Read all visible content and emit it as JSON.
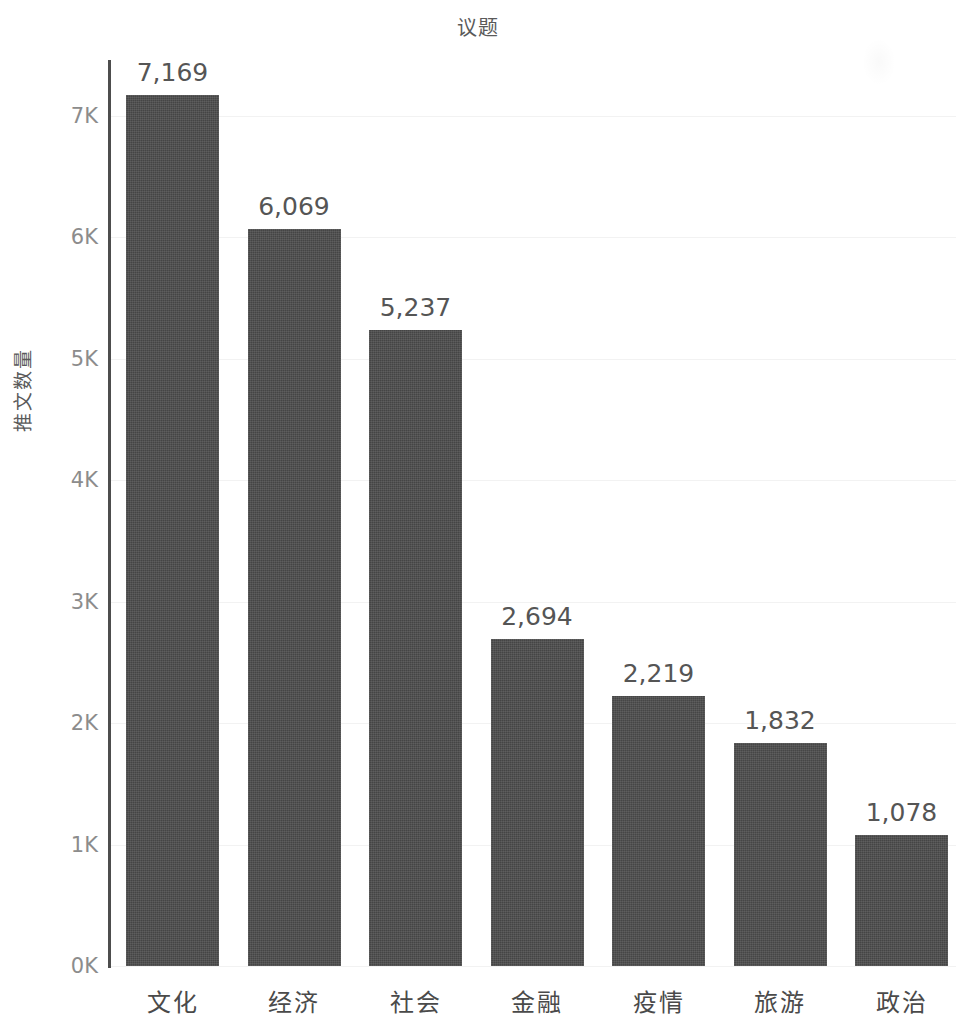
{
  "chart_data": {
    "type": "bar",
    "title": "议题",
    "xlabel": "",
    "ylabel": "推文数量",
    "categories": [
      "文化",
      "经济",
      "社会",
      "金融",
      "疫情",
      "旅游",
      "政治"
    ],
    "values": [
      7169,
      6069,
      5237,
      2694,
      2219,
      1832,
      1078
    ],
    "value_labels": [
      "7,169",
      "6,069",
      "5,237",
      "2,694",
      "2,219",
      "1,832",
      "1,078"
    ],
    "ylim": [
      0,
      7500
    ],
    "ytick_values": [
      0,
      1000,
      2000,
      3000,
      4000,
      5000,
      6000,
      7000
    ],
    "ytick_labels": [
      "0K",
      "1K",
      "2K",
      "3K",
      "4K",
      "5K",
      "6K",
      "7K"
    ],
    "grid": true,
    "legend": false,
    "bar_color": "#4c4c4c",
    "text_color": "#4a4a4a",
    "tick_color": "#8c8c8c",
    "gridline_color": "#f2f2f2",
    "background_color": "#ffffff"
  }
}
